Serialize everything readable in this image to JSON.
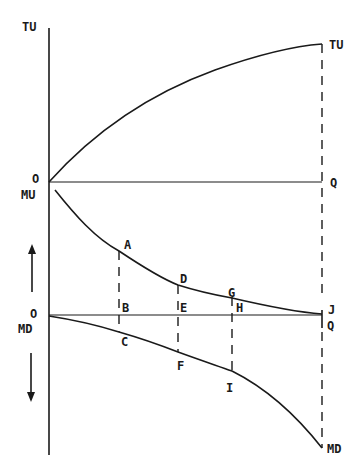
{
  "figure": {
    "upper_panel": {
      "y_axis_label": "TU",
      "origin_label": "O",
      "curve_end_label": "TU",
      "x_end_label": "Q"
    },
    "lower_panel": {
      "top_axis_label": "MU",
      "origin_label": "O",
      "bottom_axis_label": "MD",
      "mu_end_label": "J",
      "x_end_label": "Q",
      "md_end_label": "MD"
    },
    "points": {
      "A": "A",
      "B": "B",
      "C": "C",
      "D": "D",
      "E": "E",
      "F": "F",
      "G": "G",
      "H": "H",
      "I": "I"
    },
    "arrows": {
      "up": "up-arrow (MU positive)",
      "down": "down-arrow (MD)"
    },
    "colors": {
      "ink": "#1a1a1a",
      "background": "#ffffff"
    }
  }
}
